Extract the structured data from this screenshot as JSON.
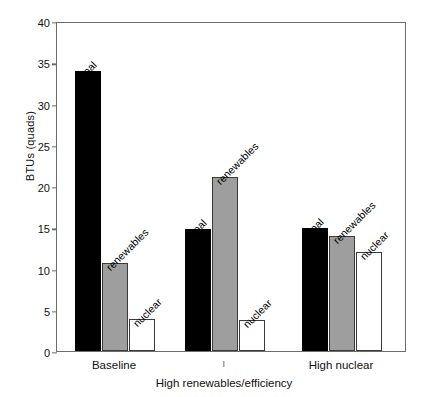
{
  "chart_data": {
    "type": "bar",
    "title": "",
    "xlabel": "",
    "ylabel": "BTUs (quads)",
    "ylim": [
      0,
      40
    ],
    "yticks": [
      0,
      5,
      10,
      15,
      20,
      25,
      30,
      35,
      40
    ],
    "grid": false,
    "legend_position": "none",
    "annotations_style": "per-bar rotated labels",
    "categories": [
      "Baseline",
      "High renewables/efficiency",
      "High nuclear"
    ],
    "series": [
      {
        "name": "coal",
        "values": [
          33.9,
          14.8,
          14.9
        ]
      },
      {
        "name": "renewables",
        "values": [
          10.7,
          21.1,
          14.0
        ]
      },
      {
        "name": "nuclear",
        "values": [
          3.9,
          3.8,
          12.0
        ]
      }
    ],
    "series_colors": {
      "coal": "#000000",
      "renewables": "#9e9e9e",
      "nuclear": "#ffffff"
    },
    "bar_labels": [
      [
        "coal",
        "renewables",
        "nuclear"
      ],
      [
        "coal",
        "renewables",
        "nuclear"
      ],
      [
        "coal",
        "renewables",
        "nuclear"
      ]
    ],
    "axis_color": "#6d6d6d"
  }
}
